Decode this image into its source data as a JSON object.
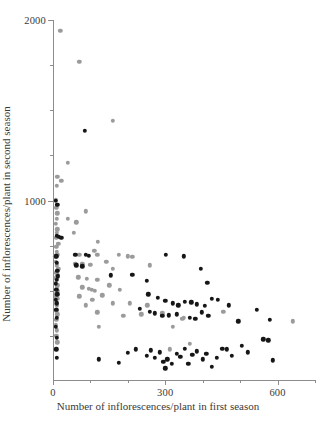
{
  "chart_data": {
    "type": "scatter",
    "title": "",
    "xlabel": "Number of inflorescences/plant in first season",
    "ylabel": "Number of inflorescences/plant in second season",
    "xlim": [
      0,
      700
    ],
    "ylim": [
      0,
      2000
    ],
    "xticks": [
      0,
      300,
      600
    ],
    "xtick_labels": [
      "0",
      "300",
      "600"
    ],
    "xticks_minor": [
      100,
      200,
      400,
      500,
      700
    ],
    "yticks": [
      1000,
      2000
    ],
    "ytick_labels": [
      "1000",
      "2000"
    ],
    "yticks_minor": [
      250,
      500,
      750,
      1250,
      1500,
      1750
    ],
    "grid": false,
    "legend": "none",
    "colors": {
      "series1": "#9b9b9b",
      "series2": "#161616",
      "axis": "#8c8c8c",
      "text": "#3a3a3a",
      "background": "#ffffff"
    },
    "series": [
      {
        "name": "series1",
        "color": "#9b9b9b",
        "points": [
          [
            20,
            1940
          ],
          [
            70,
            1770
          ],
          [
            160,
            1440
          ],
          [
            40,
            1210
          ],
          [
            12,
            1130
          ],
          [
            22,
            1110
          ],
          [
            10,
            1080
          ],
          [
            62,
            880
          ],
          [
            88,
            940
          ],
          [
            120,
            770
          ],
          [
            8,
            1005
          ],
          [
            9,
            960
          ],
          [
            11,
            930
          ],
          [
            10,
            900
          ],
          [
            8,
            870
          ],
          [
            12,
            840
          ],
          [
            10,
            820
          ],
          [
            9,
            795
          ],
          [
            40,
            900
          ],
          [
            55,
            820
          ],
          [
            14,
            760
          ],
          [
            9,
            745
          ],
          [
            10,
            715
          ],
          [
            12,
            700
          ],
          [
            6,
            690
          ],
          [
            70,
            700
          ],
          [
            110,
            720
          ],
          [
            118,
            700
          ],
          [
            175,
            700
          ],
          [
            200,
            690
          ],
          [
            212,
            688
          ],
          [
            8,
            660
          ],
          [
            10,
            640
          ],
          [
            14,
            620
          ],
          [
            60,
            650
          ],
          [
            78,
            650
          ],
          [
            100,
            645
          ],
          [
            142,
            660
          ],
          [
            258,
            640
          ],
          [
            160,
            620
          ],
          [
            9,
            600
          ],
          [
            12,
            585
          ],
          [
            7,
            570
          ],
          [
            68,
            575
          ],
          [
            90,
            565
          ],
          [
            118,
            560
          ],
          [
            8,
            545
          ],
          [
            11,
            530
          ],
          [
            10,
            515
          ],
          [
            13,
            500
          ],
          [
            78,
            520
          ],
          [
            96,
            512
          ],
          [
            104,
            505
          ],
          [
            112,
            500
          ],
          [
            150,
            530
          ],
          [
            178,
            505
          ],
          [
            9,
            480
          ],
          [
            8,
            465
          ],
          [
            12,
            455
          ],
          [
            70,
            470
          ],
          [
            105,
            450
          ],
          [
            132,
            475
          ],
          [
            9,
            430
          ],
          [
            10,
            415
          ],
          [
            88,
            420
          ],
          [
            160,
            430
          ],
          [
            205,
            430
          ],
          [
            252,
            420
          ],
          [
            9,
            390
          ],
          [
            11,
            370
          ],
          [
            118,
            380
          ],
          [
            188,
            360
          ],
          [
            236,
            370
          ],
          [
            292,
            375
          ],
          [
            9,
            340
          ],
          [
            8,
            310
          ],
          [
            10,
            280
          ],
          [
            122,
            300
          ],
          [
            320,
            300
          ],
          [
            9,
            250
          ],
          [
            11,
            215
          ],
          [
            345,
            345
          ],
          [
            350,
            350
          ],
          [
            312,
            175
          ],
          [
            365,
            205
          ],
          [
            455,
            385
          ],
          [
            640,
            330
          ]
        ]
      },
      {
        "name": "series2",
        "color": "#161616",
        "points": [
          [
            85,
            1385
          ],
          [
            8,
            1000
          ],
          [
            12,
            975
          ],
          [
            10,
            805
          ],
          [
            16,
            800
          ],
          [
            22,
            795
          ],
          [
            60,
            700
          ],
          [
            88,
            700
          ],
          [
            96,
            695
          ],
          [
            9,
            690
          ],
          [
            10,
            655
          ],
          [
            62,
            640
          ],
          [
            78,
            635
          ],
          [
            11,
            610
          ],
          [
            13,
            580
          ],
          [
            155,
            585
          ],
          [
            212,
            590
          ],
          [
            10,
            560
          ],
          [
            8,
            540
          ],
          [
            250,
            555
          ],
          [
            9,
            505
          ],
          [
            11,
            480
          ],
          [
            302,
            700
          ],
          [
            350,
            690
          ],
          [
            395,
            620
          ],
          [
            412,
            545
          ],
          [
            8,
            450
          ],
          [
            10,
            430
          ],
          [
            255,
            480
          ],
          [
            280,
            460
          ],
          [
            300,
            445
          ],
          [
            320,
            430
          ],
          [
            335,
            420
          ],
          [
            352,
            440
          ],
          [
            370,
            435
          ],
          [
            385,
            425
          ],
          [
            405,
            415
          ],
          [
            425,
            455
          ],
          [
            440,
            450
          ],
          [
            9,
            395
          ],
          [
            10,
            350
          ],
          [
            232,
            400
          ],
          [
            258,
            385
          ],
          [
            272,
            375
          ],
          [
            292,
            360
          ],
          [
            310,
            365
          ],
          [
            330,
            370
          ],
          [
            365,
            350
          ],
          [
            380,
            345
          ],
          [
            398,
            380
          ],
          [
            415,
            360
          ],
          [
            470,
            420
          ],
          [
            495,
            330
          ],
          [
            545,
            395
          ],
          [
            580,
            340
          ],
          [
            8,
            300
          ],
          [
            10,
            240
          ],
          [
            122,
            120
          ],
          [
            175,
            100
          ],
          [
            200,
            155
          ],
          [
            222,
            175
          ],
          [
            250,
            140
          ],
          [
            262,
            170
          ],
          [
            272,
            130
          ],
          [
            285,
            160
          ],
          [
            295,
            105
          ],
          [
            300,
            70
          ],
          [
            305,
            120
          ],
          [
            318,
            95
          ],
          [
            330,
            150
          ],
          [
            340,
            135
          ],
          [
            352,
            180
          ],
          [
            362,
            95
          ],
          [
            372,
            145
          ],
          [
            385,
            165
          ],
          [
            400,
            120
          ],
          [
            410,
            150
          ],
          [
            425,
            80
          ],
          [
            438,
            130
          ],
          [
            452,
            180
          ],
          [
            465,
            175
          ],
          [
            478,
            140
          ],
          [
            505,
            195
          ],
          [
            520,
            160
          ],
          [
            562,
            230
          ],
          [
            575,
            225
          ],
          [
            588,
            115
          ],
          [
            9,
            175
          ],
          [
            10,
            130
          ]
        ]
      }
    ]
  }
}
